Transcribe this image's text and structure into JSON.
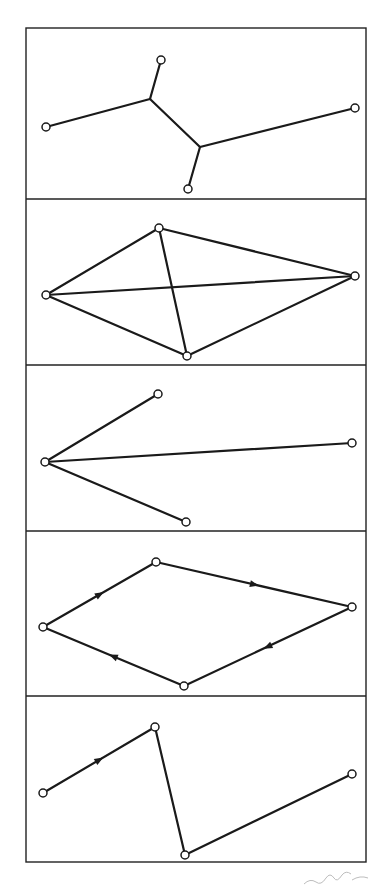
{
  "figure": {
    "frame": {
      "x_left": 26,
      "x_right": 366,
      "y_top": 28,
      "y_bottom": 862
    },
    "dividers_y": [
      199,
      365,
      531,
      696
    ],
    "panels": [
      {
        "name": "tree",
        "nodes": [
          [
            46,
            127
          ],
          [
            161,
            60
          ],
          [
            355,
            108
          ],
          [
            188,
            189
          ]
        ],
        "junctions": [
          [
            150,
            99
          ],
          [
            200,
            147
          ]
        ],
        "edges": [
          [
            [
              46,
              127
            ],
            [
              150,
              99
            ]
          ],
          [
            [
              150,
              99
            ],
            [
              161,
              60
            ]
          ],
          [
            [
              150,
              99
            ],
            [
              200,
              147
            ]
          ],
          [
            [
              200,
              147
            ],
            [
              355,
              108
            ]
          ],
          [
            [
              200,
              147
            ],
            [
              188,
              189
            ]
          ]
        ],
        "arrows": []
      },
      {
        "name": "complete-graph",
        "nodes": [
          [
            46,
            295
          ],
          [
            159,
            228
          ],
          [
            355,
            276
          ],
          [
            187,
            356
          ]
        ],
        "edges": [
          [
            [
              46,
              295
            ],
            [
              159,
              228
            ]
          ],
          [
            [
              159,
              228
            ],
            [
              355,
              276
            ]
          ],
          [
            [
              355,
              276
            ],
            [
              187,
              356
            ]
          ],
          [
            [
              187,
              356
            ],
            [
              46,
              295
            ]
          ],
          [
            [
              46,
              295
            ],
            [
              355,
              276
            ]
          ],
          [
            [
              159,
              228
            ],
            [
              187,
              356
            ]
          ]
        ],
        "arrows": []
      },
      {
        "name": "star",
        "nodes": [
          [
            45,
            462
          ],
          [
            158,
            394
          ],
          [
            352,
            443
          ],
          [
            186,
            522
          ]
        ],
        "edges": [
          [
            [
              45,
              462
            ],
            [
              158,
              394
            ]
          ],
          [
            [
              45,
              462
            ],
            [
              352,
              443
            ]
          ],
          [
            [
              45,
              462
            ],
            [
              186,
              522
            ]
          ]
        ],
        "arrows": []
      },
      {
        "name": "directed-cycle",
        "nodes": [
          [
            43,
            627
          ],
          [
            156,
            562
          ],
          [
            352,
            607
          ],
          [
            184,
            686
          ]
        ],
        "edges": [
          [
            [
              43,
              627
            ],
            [
              156,
              562
            ]
          ],
          [
            [
              156,
              562
            ],
            [
              352,
              607
            ]
          ],
          [
            [
              352,
              607
            ],
            [
              184,
              686
            ]
          ],
          [
            [
              184,
              686
            ],
            [
              43,
              627
            ]
          ]
        ],
        "arrows": [
          [
            [
              43,
              627
            ],
            [
              156,
              562
            ]
          ],
          [
            [
              156,
              562
            ],
            [
              352,
              607
            ]
          ],
          [
            [
              352,
              607
            ],
            [
              184,
              686
            ]
          ],
          [
            [
              184,
              686
            ],
            [
              43,
              627
            ]
          ]
        ]
      },
      {
        "name": "directed-path",
        "nodes": [
          [
            43,
            793
          ],
          [
            155,
            727
          ],
          [
            185,
            855
          ],
          [
            352,
            774
          ]
        ],
        "edges": [
          [
            [
              43,
              793
            ],
            [
              155,
              727
            ]
          ],
          [
            [
              155,
              727
            ],
            [
              185,
              855
            ]
          ],
          [
            [
              185,
              855
            ],
            [
              352,
              774
            ]
          ]
        ],
        "arrows": [
          [
            [
              43,
              793
            ],
            [
              155,
              727
            ]
          ]
        ]
      }
    ]
  }
}
